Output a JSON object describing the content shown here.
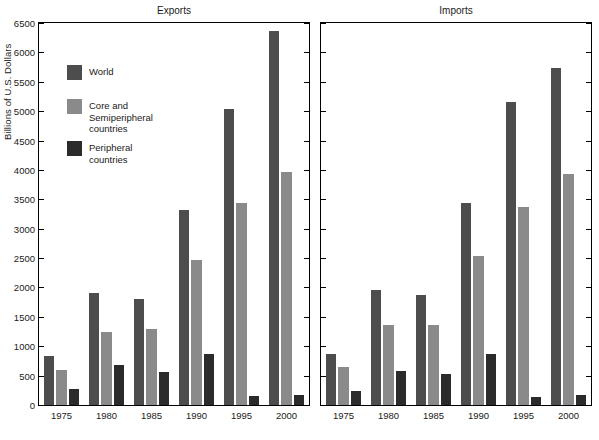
{
  "chart_data": {
    "type": "bar",
    "title": "",
    "ylabel": "Billions of U.S. Dollars",
    "xlabel": "",
    "ylim": [
      0,
      6500
    ],
    "ytick_step": 500,
    "yticks": [
      0,
      500,
      1000,
      1500,
      2000,
      2500,
      3000,
      3500,
      4000,
      4500,
      5000,
      5500,
      6000,
      6500
    ],
    "ytick_labels": [
      "0",
      "500",
      "1000",
      "1500",
      "2000",
      "2500",
      "3000",
      "3500",
      "4000",
      "4500",
      "5000",
      "5500",
      "6000",
      "6500"
    ],
    "grid": false,
    "legend_position": "top-left of left panel",
    "categories": [
      "1975",
      "1980",
      "1985",
      "1990",
      "1995",
      "2000"
    ],
    "series": [
      {
        "name": "World",
        "color": "#4d4d4d"
      },
      {
        "name": "Core and\nSemiperipheral\ncountries",
        "color": "#8a8a8a"
      },
      {
        "name": "Peripheral\ncountries",
        "color": "#2b2b2b"
      }
    ],
    "panels": [
      {
        "title": "Exports",
        "values": {
          "World": [
            830,
            1910,
            1810,
            3320,
            5040,
            6370
          ],
          "Core and Semiperipheral countries": [
            590,
            1250,
            1290,
            2460,
            3430,
            3960
          ],
          "Peripheral countries": [
            280,
            680,
            570,
            870,
            160,
            175
          ]
        }
      },
      {
        "title": "Imports",
        "values": {
          "World": [
            860,
            1960,
            1880,
            3430,
            5150,
            5740
          ],
          "Core and Semiperipheral countries": [
            640,
            1370,
            1360,
            2540,
            3370,
            3930
          ],
          "Peripheral countries": [
            240,
            580,
            520,
            860,
            135,
            165
          ]
        }
      }
    ]
  }
}
